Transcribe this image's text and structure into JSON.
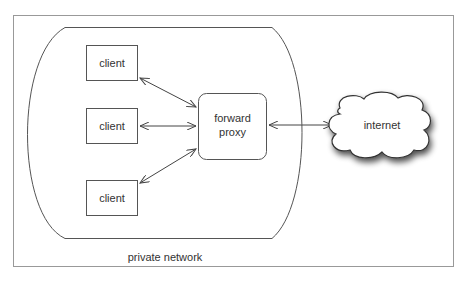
{
  "diagram": {
    "clients": [
      {
        "label": "client"
      },
      {
        "label": "client"
      },
      {
        "label": "client"
      }
    ],
    "proxy": {
      "line1": "forward",
      "line2": "proxy"
    },
    "cloud": {
      "label": "internet"
    },
    "network": {
      "label": "private network"
    }
  },
  "colors": {
    "stroke": "#444444",
    "text": "#333333",
    "frame": "#888888"
  }
}
